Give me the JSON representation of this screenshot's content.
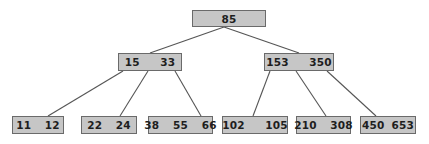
{
  "diagram": {
    "type": "b-tree",
    "root": {
      "keys": "85"
    },
    "internal": [
      {
        "keys": "15   33"
      },
      {
        "keys": "153   350"
      }
    ],
    "leaves": [
      {
        "keys": "11  12"
      },
      {
        "keys": "22  24"
      },
      {
        "keys": "38  55  66"
      },
      {
        "keys": "102   105"
      },
      {
        "keys": "210  308"
      },
      {
        "keys": "450 653"
      }
    ],
    "colors": {
      "node_fill": "#c6c6c6",
      "node_border": "#6a6a6a",
      "edge": "#555555",
      "text": "#1e1e1e"
    }
  }
}
